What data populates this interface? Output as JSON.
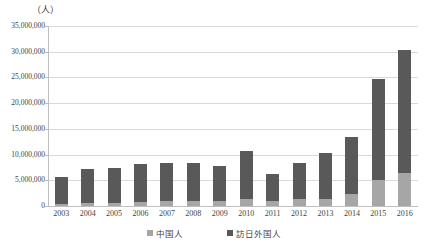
{
  "chart_data": {
    "type": "bar",
    "stacked": true,
    "title": "",
    "subtitle": "",
    "unit_label": "（人）",
    "xlabel": "",
    "ylabel": "",
    "ylim": [
      0,
      35000000
    ],
    "ytick_values": [
      0,
      5000000,
      10000000,
      15000000,
      20000000,
      25000000,
      30000000,
      35000000
    ],
    "ytick_labels": [
      "0",
      "5,000,000",
      "10,000,000",
      "15,000,000",
      "20,000,000",
      "25,000,000",
      "30,000,000",
      "35,000,000"
    ],
    "grid": true,
    "grid_axis": "y",
    "legend_position": "bottom",
    "categories": [
      "2003",
      "2004",
      "2005",
      "2006",
      "2007",
      "2008",
      "2009",
      "2010",
      "2011",
      "2012",
      "2013",
      "2014",
      "2015",
      "2016"
    ],
    "series": [
      {
        "name": "中国人",
        "color": "#a6a6a6",
        "values": [
          450000,
          620000,
          650000,
          810000,
          940000,
          1000000,
          1010000,
          1410000,
          1040000,
          1430000,
          1310000,
          2410000,
          4990000,
          6370000
        ]
      },
      {
        "name": "訪日外国人",
        "color": "#595959",
        "values": [
          5210000,
          6520000,
          6720000,
          7330000,
          7400000,
          7350000,
          6780000,
          9200000,
          5180000,
          6930000,
          9040000,
          10990000,
          19740000,
          24040000
        ]
      }
    ],
    "totals": [
      5660000,
      7140000,
      7370000,
      8140000,
      8340000,
      8350000,
      7790000,
      10610000,
      6220000,
      8360000,
      10350000,
      13400000,
      24730000,
      30410000
    ]
  },
  "legend": {
    "items": [
      {
        "label": "中国人",
        "color": "#a6a6a6"
      },
      {
        "label": "訪日外国人",
        "color": "#595959"
      }
    ]
  },
  "colors": {
    "series_dark": "#595959",
    "series_light": "#a6a6a6",
    "grid": "#d9d9d9",
    "axis": "#bfbfbf",
    "text": "#3f3f3f",
    "background": "#ffffff"
  }
}
